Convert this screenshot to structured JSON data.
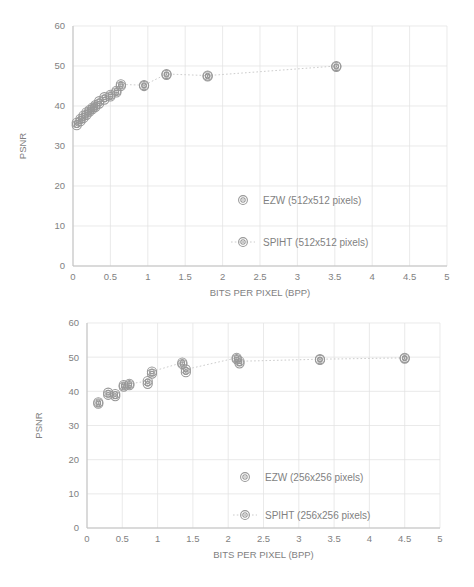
{
  "page": {
    "background": "#ffffff",
    "marker_color": "#8a8a8a",
    "line_color": "#bfbfbf",
    "grid_color": "#dedede",
    "text_color": "#6f6f6f"
  },
  "chart_data": [
    {
      "id": "top",
      "type": "scatter",
      "title": "",
      "xlabel": "BITS PER PIXEL (BPP)",
      "ylabel": "PSNR",
      "xlim": [
        0,
        5
      ],
      "ylim": [
        0,
        60
      ],
      "xticks": [
        0,
        0.5,
        1,
        1.5,
        2,
        2.5,
        3,
        3.5,
        4,
        4.5,
        5
      ],
      "xtick_labels": [
        "0",
        "0.5",
        "1",
        "1.5",
        "2",
        "2.5",
        "3",
        "3.5",
        "4",
        "4.5",
        "5"
      ],
      "yticks": [
        0,
        10,
        20,
        30,
        40,
        50,
        60
      ],
      "ytick_labels": [
        "0",
        "10",
        "20",
        "30",
        "40",
        "50",
        "60"
      ],
      "grid": true,
      "legend_position": "inside-lower-right",
      "series": [
        {
          "name": "EZW (512x512 pixels)",
          "marker": "bullseye",
          "line": false,
          "x": [
            0.05,
            0.1,
            0.14,
            0.18,
            0.22,
            0.26,
            0.3,
            0.35,
            0.42,
            0.5,
            0.58,
            0.64,
            0.95,
            1.25,
            1.8,
            3.52
          ],
          "y": [
            35.2,
            36.2,
            37.0,
            37.8,
            38.6,
            39.2,
            39.8,
            40.6,
            41.6,
            42.4,
            43.4,
            45.0,
            45.0,
            47.8,
            47.4,
            49.8
          ]
        },
        {
          "name": "SPIHT (512x512 pixels)",
          "marker": "bullseye",
          "line": true,
          "x": [
            0.05,
            0.1,
            0.14,
            0.18,
            0.22,
            0.26,
            0.3,
            0.35,
            0.42,
            0.5,
            0.58,
            0.64,
            0.95,
            1.25,
            1.8,
            3.52
          ],
          "y": [
            35.8,
            36.8,
            37.6,
            38.4,
            39.0,
            39.6,
            40.2,
            41.2,
            42.2,
            42.8,
            43.8,
            45.4,
            45.2,
            48.0,
            47.6,
            50.0
          ]
        }
      ]
    },
    {
      "id": "bottom",
      "type": "scatter",
      "title": "",
      "xlabel": "BITS PER PIXEL (BPP)",
      "ylabel": "PSNR",
      "xlim": [
        0,
        5
      ],
      "ylim": [
        0,
        60
      ],
      "xticks": [
        0,
        0.5,
        1,
        1.5,
        2,
        2.5,
        3,
        3.5,
        4,
        4.5,
        5
      ],
      "xtick_labels": [
        "0",
        "0.5",
        "1",
        "1.5",
        "2",
        "2.5",
        "3",
        "3.5",
        "4",
        "4.5",
        "5"
      ],
      "yticks": [
        0,
        10,
        20,
        30,
        40,
        50,
        60
      ],
      "ytick_labels": [
        "0",
        "10",
        "20",
        "30",
        "40",
        "50",
        "60"
      ],
      "grid": true,
      "legend_position": "inside-lower-right",
      "series": [
        {
          "name": "EZW (256x256 pixels)",
          "marker": "bullseye",
          "line": false,
          "x": [
            0.16,
            0.3,
            0.4,
            0.52,
            0.6,
            0.86,
            0.92,
            1.35,
            1.4,
            2.12,
            2.16,
            3.3,
            4.5
          ],
          "y": [
            36.4,
            39.0,
            38.6,
            41.4,
            41.8,
            42.2,
            45.2,
            48.0,
            45.6,
            49.4,
            48.2,
            49.2,
            49.6
          ]
        },
        {
          "name": "SPIHT (256x256 pixels)",
          "marker": "bullseye",
          "line": true,
          "x": [
            0.16,
            0.3,
            0.4,
            0.52,
            0.6,
            0.86,
            0.92,
            1.35,
            1.4,
            2.12,
            2.16,
            3.3,
            4.5
          ],
          "y": [
            36.8,
            39.6,
            39.2,
            41.8,
            42.2,
            43.0,
            45.8,
            48.4,
            46.4,
            49.8,
            48.8,
            49.4,
            49.8
          ]
        }
      ]
    }
  ]
}
